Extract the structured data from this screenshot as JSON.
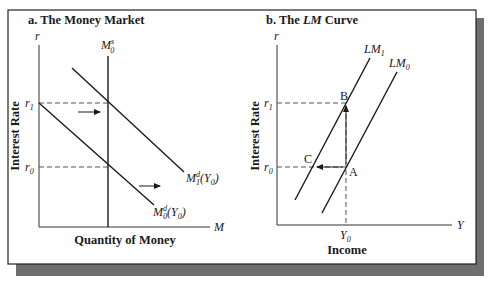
{
  "figure": {
    "panel_a": {
      "title": "a. The Money Market",
      "y_axis_symbol": "r",
      "x_axis_symbol": "M",
      "y_axis_label": "Interest Rate",
      "x_axis_label": "Quantity of Money",
      "tick_r1": "r",
      "tick_r1_sub": "1",
      "tick_r0": "r",
      "tick_r0_sub": "0",
      "supply_curve": {
        "base": "M",
        "sup": "s",
        "sub": "0"
      },
      "demand_curve_1": {
        "base": "M",
        "sup": "d",
        "sub": "1",
        "arg": "(Y",
        "arg_sub": "0",
        "arg_close": ")"
      },
      "demand_curve_0": {
        "base": "M",
        "sup": "d",
        "sub": "0",
        "arg": "(Y",
        "arg_sub": "0",
        "arg_close": ")"
      }
    },
    "panel_b": {
      "title_prefix": "b. The ",
      "title_italic": "LM",
      "title_suffix": " Curve",
      "y_axis_symbol": "r",
      "x_axis_symbol": "Y",
      "y_axis_label": "Interest Rate",
      "x_axis_label": "Income",
      "tick_r1": "r",
      "tick_r1_sub": "1",
      "tick_r0": "r",
      "tick_r0_sub": "0",
      "tick_y0": "Y",
      "tick_y0_sub": "0",
      "curve_lm1": {
        "base": "LM",
        "sub": "1"
      },
      "curve_lm0": {
        "base": "LM",
        "sub": "0"
      },
      "point_a": "A",
      "point_b": "B",
      "point_c": "C"
    },
    "colors": {
      "ink": "#1a1a1a",
      "frame": "#222222",
      "shadow": "#6e6e6e",
      "background": "#ffffff"
    }
  }
}
